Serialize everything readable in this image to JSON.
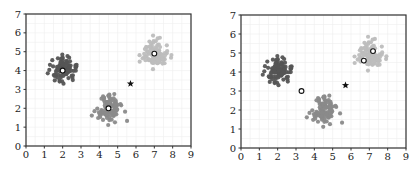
{
  "chart_data": [
    {
      "type": "scatter",
      "title": "",
      "xlabel": "",
      "ylabel": "",
      "xlim": [
        0,
        9
      ],
      "ylim": [
        0,
        7
      ],
      "x_ticks": [
        0,
        1,
        2,
        3,
        4,
        5,
        6,
        7,
        8,
        9
      ],
      "y_ticks": [
        0,
        1,
        2,
        3,
        4,
        5,
        6,
        7
      ],
      "grid": true,
      "legend": null,
      "series": [
        {
          "name": "cluster-1",
          "color": "#555555",
          "center": [
            2.0,
            4.0
          ],
          "spread": 0.35,
          "count": 100
        },
        {
          "name": "cluster-2",
          "color": "#8a8a8a",
          "center": [
            4.5,
            2.0
          ],
          "spread": 0.35,
          "count": 100
        },
        {
          "name": "cluster-3",
          "color": "#bdbdbd",
          "center": [
            7.0,
            4.9
          ],
          "spread": 0.35,
          "count": 100
        }
      ],
      "centroids": [
        [
          2.0,
          4.0
        ],
        [
          4.5,
          2.0
        ],
        [
          7.0,
          4.9
        ]
      ],
      "star": [
        5.7,
        3.3
      ]
    },
    {
      "type": "scatter",
      "title": "",
      "xlabel": "",
      "ylabel": "",
      "xlim": [
        0,
        9
      ],
      "ylim": [
        0,
        7
      ],
      "x_ticks": [
        0,
        1,
        2,
        3,
        4,
        5,
        6,
        7,
        8,
        9
      ],
      "y_ticks": [
        0,
        1,
        2,
        3,
        4,
        5,
        6,
        7
      ],
      "grid": true,
      "legend": null,
      "series": [
        {
          "name": "cluster-1",
          "color": "#555555",
          "center": [
            2.0,
            4.0
          ],
          "spread": 0.35,
          "count": 100
        },
        {
          "name": "cluster-2",
          "color": "#8a8a8a",
          "center": [
            4.5,
            2.0
          ],
          "spread": 0.35,
          "count": 100
        },
        {
          "name": "cluster-3",
          "color": "#bdbdbd",
          "center": [
            7.0,
            4.9
          ],
          "spread": 0.35,
          "count": 100
        }
      ],
      "centroids": [
        [
          3.3,
          3.0
        ],
        [
          6.7,
          4.6
        ],
        [
          7.2,
          5.1
        ]
      ],
      "star": [
        5.7,
        3.3
      ]
    }
  ],
  "plots": [
    {
      "id": "left",
      "plot_box": {
        "x0": 26,
        "x1": 191,
        "y0": 146,
        "y1": 14
      }
    },
    {
      "id": "right",
      "plot_box": {
        "x0": 31,
        "x1": 196,
        "y0": 148,
        "y1": 15
      }
    }
  ]
}
